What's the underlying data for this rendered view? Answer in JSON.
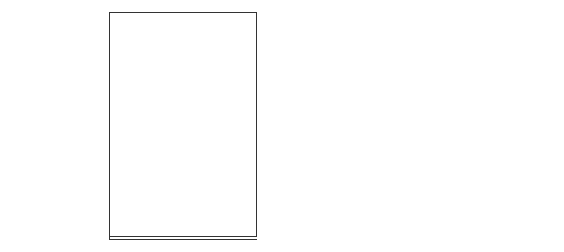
{
  "figure": {
    "number": "Figure 6-2",
    "title_line1": "Role of",
    "title_line2": "Report Definition"
  },
  "boxes": [
    {
      "line1": "MODEL",
      "line2": "SOLUTION",
      "line3": ""
    },
    {
      "line1": "REPORT",
      "line2": "DEFINITON",
      "line3": ""
    },
    {
      "line1": "MANAGEMENT",
      "line2": "SYLE",
      "line3": "REPORT"
    }
  ],
  "captions": [
    {
      "line1": "Solution",
      "line2": "of report",
      "line3": "DATA"
    },
    {
      "line1": "Description",
      "line2": "of Report",
      "line3": "LAYOUT"
    },
    {
      "line1": "Final",
      "line2": "REPORT",
      "line3": ""
    }
  ],
  "input_label": "IFPS REPORT",
  "colors": {
    "box_fill": "#bdbdbd",
    "border": "#333333",
    "arrow_fill": "#a9a9a9"
  }
}
